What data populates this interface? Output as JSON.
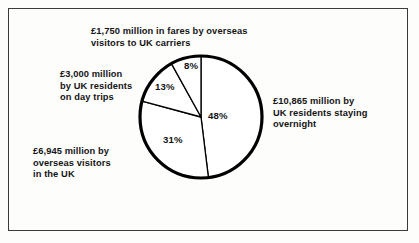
{
  "figure": {
    "background_color": "#fdfdfc",
    "frame_color": "#3a3a3a",
    "text_color": "#141414",
    "pie_stroke_color": "#000000"
  },
  "callouts": {
    "fares": "£1,750 million in fares by overseas\nvisitors to UK carriers",
    "day_trips": "£3,000 million\nby UK residents\non day trips",
    "overseas_visitors": "£6,945 million by\noverseas visitors\nin the UK",
    "staying_overnight": "£10,865 million by\nUK residents staying\novernight"
  },
  "percent_labels": {
    "overnight": "48%",
    "overseas": "31%",
    "day_trips": "13%",
    "fares": "8%"
  },
  "chart_data": {
    "type": "pie",
    "title": "",
    "units": "£ million",
    "legend_position": "callout-labels",
    "grid": false,
    "center": {
      "x": 201,
      "y": 117
    },
    "radius": 61,
    "start_angle_deg": 0,
    "direction": "clockwise",
    "categories": [
      "£10,865 million by UK residents staying overnight",
      "£6,945 million by overseas visitors in the UK",
      "£3,000 million by UK residents on day trips",
      "£1,750 million in fares by overseas visitors to UK carriers"
    ],
    "short_names": [
      "UK residents staying overnight",
      "Overseas visitors in the UK",
      "UK residents on day trips",
      "Fares by overseas visitors to UK carriers"
    ],
    "values": [
      10865,
      6945,
      3000,
      1750
    ],
    "percentages": [
      48,
      31,
      13,
      8
    ],
    "slices": [
      {
        "label": "UK residents staying overnight",
        "value": 10865,
        "percent": 48,
        "start_deg": 0,
        "end_deg": 173,
        "fill": "#ffffff",
        "stroke": "#000000"
      },
      {
        "label": "Overseas visitors in the UK",
        "value": 6945,
        "percent": 31,
        "start_deg": 173,
        "end_deg": 285,
        "fill": "#ffffff",
        "stroke": "#000000"
      },
      {
        "label": "UK residents on day trips",
        "value": 3000,
        "percent": 13,
        "start_deg": 285,
        "end_deg": 331,
        "fill": "#ffffff",
        "stroke": "#000000"
      },
      {
        "label": "Fares by overseas visitors to UK carriers",
        "value": 1750,
        "percent": 8,
        "start_deg": 331,
        "end_deg": 360,
        "fill": "#ffffff",
        "stroke": "#000000"
      }
    ]
  }
}
